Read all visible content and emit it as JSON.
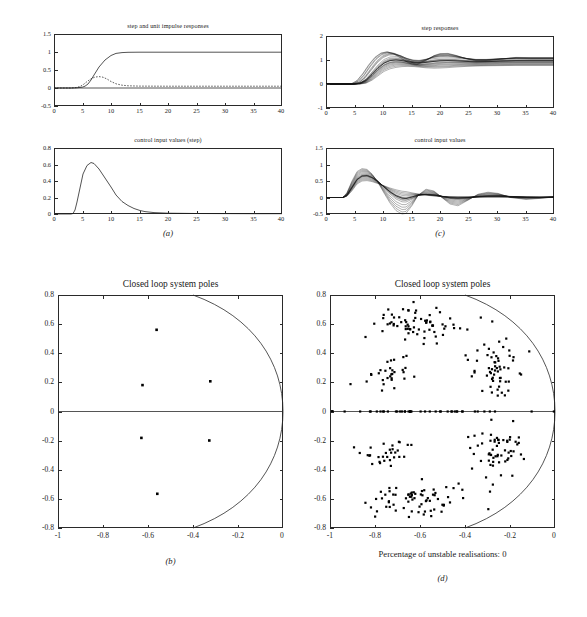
{
  "figure": {
    "panels": [
      "a",
      "b",
      "c",
      "d"
    ],
    "caption_a": "(a)",
    "caption_b": "(b)",
    "caption_c": "(c)",
    "caption_d": "(d)",
    "unstable_note": "Percentage of unstable realisations: 0"
  },
  "panel_a": {
    "title": "step and unit impulse responses",
    "xticks": [
      "0",
      "5",
      "10",
      "15",
      "20",
      "25",
      "30",
      "35",
      "40"
    ],
    "yticks": [
      "-0.5",
      "0",
      "0.5",
      "1",
      "1.5"
    ]
  },
  "panel_a2": {
    "title": "control input values (step)",
    "xticks": [
      "0",
      "5",
      "10",
      "15",
      "20",
      "25",
      "30",
      "35",
      "40"
    ],
    "yticks": [
      "0",
      "0.2",
      "0.4",
      "0.6",
      "0.8"
    ]
  },
  "panel_c": {
    "title": "step responses",
    "xticks": [
      "0",
      "5",
      "10",
      "15",
      "20",
      "25",
      "30",
      "35",
      "40"
    ],
    "yticks": [
      "-1",
      "0",
      "1",
      "2"
    ]
  },
  "panel_c2": {
    "title": "control input values",
    "xticks": [
      "0",
      "5",
      "10",
      "15",
      "20",
      "25",
      "30",
      "35",
      "40"
    ],
    "yticks": [
      "-0.5",
      "0",
      "0.5",
      "1",
      "1.5"
    ]
  },
  "panel_b": {
    "title": "Closed loop system poles",
    "xticks": [
      "-1",
      "-0.8",
      "-0.6",
      "-0.4",
      "-0.2",
      "0"
    ],
    "yticks": [
      "-0.8",
      "-0.6",
      "-0.4",
      "-0.2",
      "0",
      "0.2",
      "0.4",
      "0.6",
      "0.8"
    ]
  },
  "panel_d": {
    "title": "Closed loop system poles",
    "xticks": [
      "-1",
      "-0.8",
      "-0.6",
      "-0.4",
      "-0.2",
      "0"
    ],
    "yticks": [
      "-0.8",
      "-0.6",
      "-0.4",
      "-0.2",
      "0",
      "0.2",
      "0.4",
      "0.6",
      "0.8"
    ]
  },
  "chart_data": [
    {
      "id": "a-top",
      "type": "line",
      "title": "step and unit impulse responses",
      "xlabel": "",
      "ylabel": "",
      "xlim": [
        0,
        40
      ],
      "ylim": [
        -0.5,
        1.5
      ],
      "grid": false,
      "legend": "none",
      "series": [
        {
          "name": "step response",
          "style": "solid",
          "x": [
            0,
            1,
            2,
            3,
            4,
            5,
            6,
            7,
            8,
            9,
            10,
            11,
            12,
            13,
            14,
            15,
            16,
            18,
            20,
            25,
            30,
            35,
            40
          ],
          "y": [
            0,
            0,
            0,
            0,
            0.005,
            0.02,
            0.06,
            0.14,
            0.27,
            0.45,
            0.64,
            0.82,
            0.94,
            1.0,
            1.02,
            1.03,
            1.03,
            1.03,
            1.03,
            1.03,
            1.03,
            1.03,
            1.03
          ]
        },
        {
          "name": "unit impulse response",
          "style": "dashed",
          "x": [
            0,
            1,
            2,
            3,
            4,
            5,
            6,
            7,
            8,
            9,
            10,
            11,
            12,
            13,
            14,
            15,
            16,
            18,
            20,
            25,
            30,
            35,
            40
          ],
          "y": [
            0,
            0,
            0,
            0.005,
            0.02,
            0.05,
            0.11,
            0.18,
            0.235,
            0.25,
            0.235,
            0.195,
            0.145,
            0.1,
            0.07,
            0.055,
            0.05,
            0.045,
            0.045,
            0.045,
            0.045,
            0.045,
            0.045
          ]
        }
      ]
    },
    {
      "id": "a-bottom",
      "type": "line",
      "title": "control input values (step)",
      "xlabel": "",
      "ylabel": "",
      "xlim": [
        0,
        40
      ],
      "ylim": [
        0,
        0.8
      ],
      "grid": false,
      "legend": "none",
      "series": [
        {
          "name": "control input (step)",
          "style": "solid",
          "x": [
            0,
            1,
            2,
            3,
            3.5,
            4,
            5,
            6,
            6.8,
            7.5,
            8,
            9,
            10,
            11,
            12,
            13,
            14,
            15,
            16,
            17,
            18,
            20,
            25,
            30,
            35,
            40
          ],
          "y": [
            0,
            0,
            0,
            0.0,
            0.05,
            0.17,
            0.46,
            0.63,
            0.675,
            0.66,
            0.62,
            0.5,
            0.37,
            0.25,
            0.16,
            0.1,
            0.06,
            0.035,
            0.022,
            0.016,
            0.012,
            0.008,
            0.005,
            0.004,
            0.003,
            0.003
          ]
        }
      ]
    },
    {
      "id": "c-top",
      "type": "line",
      "title": "step responses",
      "xlabel": "",
      "ylabel": "",
      "xlim": [
        0,
        40
      ],
      "ylim": [
        -1,
        2
      ],
      "grid": false,
      "legend": "none",
      "description": "Monte Carlo bundle of ~200 step responses; all converge to 1, envelope widest near t=12-20",
      "series": [
        {
          "name": "nominal step response",
          "style": "solid",
          "x": [
            0,
            2,
            4,
            6,
            8,
            10,
            12,
            14,
            16,
            18,
            20,
            22,
            24,
            26,
            28,
            30,
            32,
            34,
            36,
            38,
            40
          ],
          "y": [
            0,
            0,
            0,
            0.02,
            0.17,
            0.52,
            0.9,
            1.06,
            1.07,
            1.02,
            0.98,
            0.99,
            1.02,
            1.04,
            1.03,
            1.0,
            0.99,
            1.0,
            1.01,
            1.02,
            1.02
          ]
        },
        {
          "name": "envelope upper",
          "style": "solid",
          "x": [
            0,
            2,
            4,
            6,
            8,
            10,
            12,
            14,
            16,
            18,
            20,
            22,
            24,
            26,
            28,
            30,
            32,
            34,
            36,
            38,
            40
          ],
          "y": [
            0,
            0,
            0,
            0.04,
            0.24,
            0.64,
            1.06,
            1.22,
            1.2,
            1.12,
            1.08,
            1.1,
            1.18,
            1.22,
            1.16,
            1.08,
            1.06,
            1.08,
            1.12,
            1.12,
            1.1
          ]
        },
        {
          "name": "envelope lower",
          "style": "solid",
          "x": [
            0,
            2,
            4,
            6,
            8,
            10,
            12,
            14,
            16,
            18,
            20,
            22,
            24,
            26,
            28,
            30,
            32,
            34,
            36,
            38,
            40
          ],
          "y": [
            0,
            0,
            0,
            0.01,
            0.11,
            0.4,
            0.76,
            0.94,
            0.96,
            0.86,
            0.76,
            0.8,
            0.9,
            0.94,
            0.92,
            0.9,
            0.9,
            0.94,
            0.96,
            0.98,
            0.98
          ]
        }
      ]
    },
    {
      "id": "c-bottom",
      "type": "line",
      "title": "control input values",
      "xlabel": "",
      "ylabel": "",
      "xlim": [
        0,
        40
      ],
      "ylim": [
        -0.5,
        1.5
      ],
      "grid": false,
      "legend": "none",
      "description": "Monte Carlo bundle of ~200 control signals; damped oscillation decaying toward 0",
      "series": [
        {
          "name": "nominal control input",
          "style": "solid",
          "x": [
            0,
            2,
            3,
            4,
            5,
            6,
            7,
            8,
            9,
            10,
            11,
            12,
            13,
            14,
            15,
            16,
            18,
            20,
            22,
            24,
            26,
            28,
            30,
            32,
            34,
            36,
            38,
            40
          ],
          "y": [
            0,
            0,
            0.01,
            0.16,
            0.45,
            0.62,
            0.66,
            0.6,
            0.48,
            0.33,
            0.18,
            0.04,
            -0.07,
            -0.12,
            -0.1,
            -0.04,
            0.04,
            0.06,
            0.03,
            -0.02,
            -0.04,
            -0.02,
            0.01,
            0.03,
            0.02,
            0.0,
            0.0,
            0.01
          ]
        },
        {
          "name": "envelope upper",
          "style": "solid",
          "x": [
            0,
            2,
            3,
            4,
            5,
            6,
            7,
            8,
            9,
            10,
            11,
            12,
            13,
            14,
            15,
            16,
            18,
            20,
            22,
            24,
            26,
            28,
            30,
            32,
            34,
            36,
            38,
            40
          ],
          "y": [
            0,
            0,
            0.02,
            0.19,
            0.49,
            0.66,
            0.7,
            0.66,
            0.56,
            0.42,
            0.27,
            0.13,
            0.02,
            -0.04,
            -0.02,
            0.06,
            0.2,
            0.24,
            0.16,
            0.05,
            0.0,
            0.03,
            0.1,
            0.14,
            0.1,
            0.05,
            0.03,
            0.04
          ]
        },
        {
          "name": "envelope lower",
          "style": "solid",
          "x": [
            0,
            2,
            3,
            4,
            5,
            6,
            7,
            8,
            9,
            10,
            11,
            12,
            13,
            14,
            15,
            16,
            18,
            20,
            22,
            24,
            26,
            28,
            30,
            32,
            34,
            36,
            38,
            40
          ],
          "y": [
            0,
            0,
            0.0,
            0.13,
            0.41,
            0.58,
            0.62,
            0.55,
            0.41,
            0.24,
            0.07,
            -0.09,
            -0.22,
            -0.29,
            -0.28,
            -0.2,
            -0.06,
            -0.02,
            -0.06,
            -0.12,
            -0.16,
            -0.14,
            -0.08,
            -0.04,
            -0.06,
            -0.07,
            -0.05,
            -0.03
          ]
        }
      ]
    },
    {
      "id": "b",
      "type": "scatter",
      "title": "Closed loop system poles",
      "xlabel": "",
      "ylabel": "",
      "xlim": [
        -1,
        0
      ],
      "ylim": [
        -0.8,
        0.8
      ],
      "grid": false,
      "legend": "none",
      "annotation": "arc of constant radius passing through (-0.4, ±0.8) and (0, 0)",
      "points": [
        {
          "x": -0.56,
          "y": 0.57
        },
        {
          "x": -0.62,
          "y": 0.19
        },
        {
          "x": -0.32,
          "y": 0.215
        },
        {
          "x": -0.625,
          "y": -0.185
        },
        {
          "x": -0.325,
          "y": -0.205
        },
        {
          "x": -0.555,
          "y": -0.565
        }
      ]
    },
    {
      "id": "d",
      "type": "scatter",
      "title": "Closed loop system poles",
      "xlabel": "",
      "ylabel": "",
      "xlim": [
        -1,
        0
      ],
      "ylim": [
        -0.8,
        0.8
      ],
      "grid": false,
      "legend": "none",
      "annotation": "Percentage of unstable realisations: 0",
      "description": "Monte Carlo pole scatter, ~6 clusters mirrored about the real axis plus a band of real poles on y=0",
      "clusters": [
        {
          "name": "upper-left complex pair",
          "center": [
            -0.6,
            0.6
          ],
          "spread": [
            0.11,
            0.055
          ],
          "count": 70
        },
        {
          "name": "mid-left complex pair",
          "center": [
            -0.74,
            0.29
          ],
          "spread": [
            0.07,
            0.055
          ],
          "count": 30
        },
        {
          "name": "right complex pair",
          "center": [
            -0.27,
            0.27
          ],
          "spread": [
            0.06,
            0.09
          ],
          "count": 58
        },
        {
          "name": "real-axis poles",
          "center": [
            -0.62,
            0.0
          ],
          "spread": [
            0.24,
            0.0
          ],
          "count": 46
        },
        {
          "name": "right complex pair (conj)",
          "center": [
            -0.27,
            -0.26
          ],
          "spread": [
            0.06,
            0.09
          ],
          "count": 58
        },
        {
          "name": "mid-left complex pair (conj)",
          "center": [
            -0.75,
            -0.3
          ],
          "spread": [
            0.07,
            0.055
          ],
          "count": 30
        },
        {
          "name": "lower-left complex pair (conj)",
          "center": [
            -0.6,
            -0.6
          ],
          "spread": [
            0.11,
            0.055
          ],
          "count": 70
        }
      ]
    }
  ]
}
